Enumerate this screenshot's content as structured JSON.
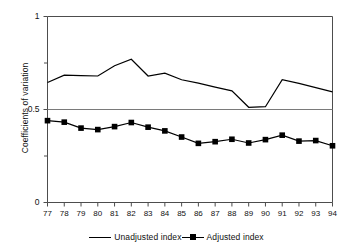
{
  "chart_data": {
    "type": "line",
    "title": "",
    "xlabel": "",
    "ylabel": "Coefficients of variation",
    "xlim": [
      77,
      94
    ],
    "ylim": [
      0,
      1
    ],
    "ytick_labels": [
      "1",
      "0.5",
      "0"
    ],
    "ytick_values": [
      1,
      0.5,
      0
    ],
    "yminor_ticks": [
      0.75,
      0.25
    ],
    "grid": "single horizontal line at 0.5",
    "legend_position": "bottom-center",
    "categories": [
      "77",
      "78",
      "79",
      "80",
      "81",
      "82",
      "83",
      "84",
      "85",
      "86",
      "87",
      "88",
      "89",
      "90",
      "91",
      "92",
      "93",
      "94"
    ],
    "series": [
      {
        "name": "Unadjusted index",
        "marker": "none",
        "values": [
          0.645,
          0.685,
          0.682,
          0.68,
          0.735,
          0.77,
          0.68,
          0.695,
          0.66,
          0.642,
          0.62,
          0.6,
          0.512,
          0.515,
          0.66,
          0.64,
          0.618,
          0.595
        ]
      },
      {
        "name": "Adjusted index",
        "marker": "square",
        "values": [
          0.44,
          0.432,
          0.4,
          0.392,
          0.408,
          0.43,
          0.405,
          0.385,
          0.352,
          0.318,
          0.327,
          0.34,
          0.32,
          0.338,
          0.362,
          0.33,
          0.333,
          0.305
        ]
      }
    ]
  },
  "legend": {
    "entries": [
      {
        "label": "Unadjusted index",
        "swatch": "line"
      },
      {
        "label": "Adjusted index",
        "swatch": "line-square-marker"
      }
    ]
  },
  "axes": {
    "y_title": "Coefficients of variation"
  },
  "colors": {
    "line": "#000000",
    "axis": "#4d4d4d",
    "gridline": "#7a7a7a",
    "background": "#ffffff"
  }
}
